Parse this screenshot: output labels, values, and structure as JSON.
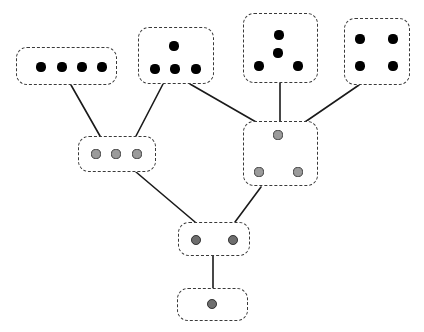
{
  "diagram": {
    "canvas": {
      "width": 424,
      "height": 332,
      "background": "#ffffff"
    },
    "style": {
      "box_border_color": "#3a3a3a",
      "box_border_style": "dashed",
      "box_corner_radius": 11,
      "edge_color": "#1a1a1a",
      "edge_width": 1.6,
      "dot_filled_color": "#000000",
      "dot_gray_color": "#9b9b9b",
      "dot_darkgray_color": "#6e6e6e",
      "dot_outline_color": "#3d3d3d"
    },
    "nodes": [
      {
        "id": "n1",
        "label": "four-dots-row",
        "dot_count": 4,
        "dot_style": "filled",
        "arrangement": "single-row",
        "box": {
          "x": 16,
          "y": 47,
          "w": 101,
          "h": 38
        },
        "dots": [
          {
            "cx": 41,
            "cy": 67,
            "r": 4.6
          },
          {
            "cx": 62,
            "cy": 67,
            "r": 4.6
          },
          {
            "cx": 82,
            "cy": 67,
            "r": 4.6
          },
          {
            "cx": 102,
            "cy": 67,
            "r": 4.6
          }
        ]
      },
      {
        "id": "n2",
        "label": "four-dots-pyramid",
        "dot_count": 4,
        "dot_style": "filled",
        "arrangement": "one-over-three",
        "box": {
          "x": 138,
          "y": 27,
          "w": 76,
          "h": 57
        },
        "dots": [
          {
            "cx": 174,
            "cy": 46,
            "r": 4.6
          },
          {
            "cx": 155,
            "cy": 69,
            "r": 4.6
          },
          {
            "cx": 175,
            "cy": 69,
            "r": 4.6
          },
          {
            "cx": 196,
            "cy": 69,
            "r": 4.6
          }
        ]
      },
      {
        "id": "n3",
        "label": "four-dots-kite",
        "dot_count": 4,
        "dot_style": "filled",
        "arrangement": "two-center-two-base",
        "box": {
          "x": 243,
          "y": 13,
          "w": 75,
          "h": 70
        },
        "dots": [
          {
            "cx": 279,
            "cy": 35,
            "r": 4.6
          },
          {
            "cx": 278,
            "cy": 53,
            "r": 4.6
          },
          {
            "cx": 259,
            "cy": 66,
            "r": 4.6
          },
          {
            "cx": 298,
            "cy": 66,
            "r": 4.6
          }
        ]
      },
      {
        "id": "n4",
        "label": "four-dots-square",
        "dot_count": 4,
        "dot_style": "filled",
        "arrangement": "two-by-two",
        "box": {
          "x": 344,
          "y": 18,
          "w": 66,
          "h": 67
        },
        "dots": [
          {
            "cx": 360,
            "cy": 39,
            "r": 4.6
          },
          {
            "cx": 393,
            "cy": 39,
            "r": 4.6
          },
          {
            "cx": 360,
            "cy": 66,
            "r": 4.6
          },
          {
            "cx": 393,
            "cy": 66,
            "r": 4.6
          }
        ]
      },
      {
        "id": "n5",
        "label": "three-dots-row",
        "dot_count": 3,
        "dot_style": "gray",
        "arrangement": "single-row",
        "box": {
          "x": 78,
          "y": 136,
          "w": 78,
          "h": 36
        },
        "dots": [
          {
            "cx": 96,
            "cy": 154,
            "r": 4.6
          },
          {
            "cx": 116,
            "cy": 154,
            "r": 4.6
          },
          {
            "cx": 137,
            "cy": 154,
            "r": 4.6
          }
        ]
      },
      {
        "id": "n6",
        "label": "three-dots-triangle",
        "dot_count": 3,
        "dot_style": "gray",
        "arrangement": "one-over-two",
        "box": {
          "x": 243,
          "y": 121,
          "w": 75,
          "h": 65
        },
        "dots": [
          {
            "cx": 278,
            "cy": 135,
            "r": 4.6
          },
          {
            "cx": 259,
            "cy": 172,
            "r": 4.6
          },
          {
            "cx": 298,
            "cy": 172,
            "r": 4.6
          }
        ]
      },
      {
        "id": "n7",
        "label": "two-dots-row",
        "dot_count": 2,
        "dot_style": "darkgray",
        "arrangement": "single-row",
        "box": {
          "x": 178,
          "y": 222,
          "w": 72,
          "h": 34
        },
        "dots": [
          {
            "cx": 196,
            "cy": 240,
            "r": 4.9
          },
          {
            "cx": 233,
            "cy": 240,
            "r": 4.9
          }
        ]
      },
      {
        "id": "n8",
        "label": "one-dot",
        "dot_count": 1,
        "dot_style": "darkgray",
        "arrangement": "single",
        "box": {
          "x": 177,
          "y": 288,
          "w": 71,
          "h": 33
        },
        "dots": [
          {
            "cx": 212,
            "cy": 304,
            "r": 4.9
          }
        ]
      }
    ],
    "edges": [
      {
        "id": "e1",
        "from": "n1",
        "to": "n5",
        "x1": 71,
        "y1": 85,
        "x2": 100,
        "y2": 136
      },
      {
        "id": "e2",
        "from": "n2",
        "to": "n5",
        "x1": 163,
        "y1": 84,
        "x2": 136,
        "y2": 136
      },
      {
        "id": "e3",
        "from": "n2",
        "to": "n6",
        "x1": 190,
        "y1": 84,
        "x2": 256,
        "y2": 122
      },
      {
        "id": "e4",
        "from": "n3",
        "to": "n6",
        "x1": 280,
        "y1": 83,
        "x2": 280,
        "y2": 121
      },
      {
        "id": "e5",
        "from": "n4",
        "to": "n6",
        "x1": 359,
        "y1": 85,
        "x2": 305,
        "y2": 122
      },
      {
        "id": "e6",
        "from": "n5",
        "to": "n7",
        "x1": 136,
        "y1": 172,
        "x2": 195,
        "y2": 222
      },
      {
        "id": "e7",
        "from": "n6",
        "to": "n7",
        "x1": 261,
        "y1": 187,
        "x2": 235,
        "y2": 222
      },
      {
        "id": "e8",
        "from": "n7",
        "to": "n8",
        "x1": 213,
        "y1": 256,
        "x2": 213,
        "y2": 288
      }
    ]
  }
}
